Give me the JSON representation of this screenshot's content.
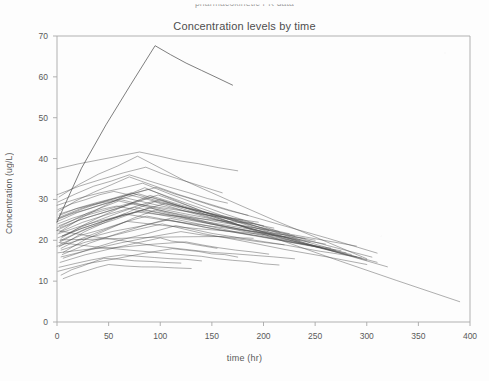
{
  "page": {
    "cut_off_header": "pharmacokinetic PK data",
    "background_color": "#fdfdfd",
    "line_color": "#4a4a4a",
    "frame_color": "#a8a8a8",
    "text_color": "#5a5a5a"
  },
  "chart_data": {
    "type": "line",
    "title": "Concentration levels by time",
    "subtitle": "",
    "xlabel": "time (hr)",
    "ylabel": "Concentration (ug/L)",
    "xlim": [
      0,
      400
    ],
    "ylim": [
      0,
      70
    ],
    "xticks": [
      0,
      50,
      100,
      150,
      200,
      250,
      300,
      350,
      400
    ],
    "xtick_labels": [
      "0",
      "50",
      "100",
      "150",
      "200",
      "250",
      "300",
      "350",
      "400"
    ],
    "yticks": [
      0,
      10,
      20,
      30,
      40,
      50,
      60,
      70
    ],
    "ytick_labels": [
      "0",
      "10",
      "20",
      "30",
      "40",
      "50",
      "60",
      "70"
    ],
    "grid": false,
    "legend": "none",
    "legend_position": "none",
    "series_count": 46,
    "series": [
      {
        "name": "subject-01",
        "x": [
          0,
          95,
          170
        ],
        "values": [
          24.5,
          67.5,
          58.0
        ]
      },
      {
        "name": "subject-02",
        "x": [
          0,
          80,
          175
        ],
        "values": [
          37.5,
          41.5,
          37.0
        ]
      },
      {
        "name": "subject-03",
        "x": [
          2,
          78,
          300
        ],
        "values": [
          30.5,
          40.5,
          15.5
        ]
      },
      {
        "name": "subject-04",
        "x": [
          3,
          85,
          390
        ],
        "values": [
          22.0,
          33.0,
          5.0
        ]
      },
      {
        "name": "subject-05",
        "x": [
          1,
          70,
          310
        ],
        "values": [
          27.0,
          35.5,
          17.0
        ]
      },
      {
        "name": "subject-06",
        "x": [
          4,
          90,
          305
        ],
        "values": [
          20.5,
          31.0,
          16.0
        ]
      },
      {
        "name": "subject-07",
        "x": [
          0,
          60,
          290
        ],
        "values": [
          23.0,
          29.5,
          18.5
        ]
      },
      {
        "name": "subject-08",
        "x": [
          2,
          100,
          300
        ],
        "values": [
          18.5,
          30.0,
          15.0
        ]
      },
      {
        "name": "subject-09",
        "x": [
          5,
          75,
          250
        ],
        "values": [
          21.0,
          28.0,
          20.0
        ]
      },
      {
        "name": "subject-10",
        "x": [
          1,
          88,
          270
        ],
        "values": [
          25.5,
          32.5,
          17.5
        ]
      },
      {
        "name": "subject-11",
        "x": [
          3,
          65,
          230
        ],
        "values": [
          19.5,
          26.5,
          21.0
        ]
      },
      {
        "name": "subject-12",
        "x": [
          0,
          92,
          310
        ],
        "values": [
          22.5,
          30.5,
          14.5
        ]
      },
      {
        "name": "subject-13",
        "x": [
          2,
          72,
          200
        ],
        "values": [
          26.0,
          31.5,
          23.5
        ]
      },
      {
        "name": "subject-14",
        "x": [
          6,
          95,
          285
        ],
        "values": [
          17.0,
          27.5,
          16.5
        ]
      },
      {
        "name": "subject-15",
        "x": [
          1,
          58,
          260
        ],
        "values": [
          24.0,
          28.5,
          19.0
        ]
      },
      {
        "name": "subject-16",
        "x": [
          3,
          105,
          295
        ],
        "values": [
          20.0,
          29.0,
          15.5
        ]
      },
      {
        "name": "subject-17",
        "x": [
          0,
          83,
          215
        ],
        "values": [
          28.5,
          34.0,
          22.0
        ]
      },
      {
        "name": "subject-18",
        "x": [
          4,
          68,
          240
        ],
        "values": [
          18.0,
          24.5,
          20.5
        ]
      },
      {
        "name": "subject-19",
        "x": [
          2,
          98,
          320
        ],
        "values": [
          23.5,
          31.0,
          13.5
        ]
      },
      {
        "name": "subject-20",
        "x": [
          1,
          76,
          190
        ],
        "values": [
          21.5,
          27.0,
          24.0
        ]
      },
      {
        "name": "subject-21",
        "x": [
          5,
          110,
          280
        ],
        "values": [
          16.5,
          25.5,
          17.0
        ]
      },
      {
        "name": "subject-22",
        "x": [
          0,
          62,
          205
        ],
        "values": [
          25.0,
          30.0,
          22.5
        ]
      },
      {
        "name": "subject-23",
        "x": [
          3,
          87,
          265
        ],
        "values": [
          19.0,
          26.0,
          18.0
        ]
      },
      {
        "name": "subject-24",
        "x": [
          2,
          93,
          235
        ],
        "values": [
          22.0,
          29.5,
          20.0
        ]
      },
      {
        "name": "subject-25",
        "x": [
          1,
          55,
          180
        ],
        "values": [
          27.5,
          32.0,
          25.0
        ]
      },
      {
        "name": "subject-26",
        "x": [
          4,
          102,
          300
        ],
        "values": [
          17.5,
          24.0,
          14.0
        ]
      },
      {
        "name": "subject-27",
        "x": [
          0,
          79,
          225
        ],
        "values": [
          24.5,
          31.5,
          21.5
        ]
      },
      {
        "name": "subject-28",
        "x": [
          6,
          115,
          290
        ],
        "values": [
          15.5,
          23.5,
          16.0
        ]
      },
      {
        "name": "subject-29",
        "x": [
          2,
          66,
          210
        ],
        "values": [
          26.5,
          30.5,
          23.0
        ]
      },
      {
        "name": "subject-30",
        "x": [
          1,
          90,
          255
        ],
        "values": [
          20.5,
          28.0,
          18.5
        ]
      },
      {
        "name": "subject-31",
        "x": [
          3,
          74,
          195
        ],
        "values": [
          23.0,
          29.0,
          24.5
        ]
      },
      {
        "name": "subject-32",
        "x": [
          0,
          108,
          275
        ],
        "values": [
          18.5,
          25.0,
          17.5
        ]
      },
      {
        "name": "subject-33",
        "x": [
          5,
          84,
          245
        ],
        "values": [
          21.0,
          27.5,
          19.5
        ]
      },
      {
        "name": "subject-34",
        "x": [
          2,
          96,
          185
        ],
        "values": [
          25.5,
          33.0,
          26.0
        ]
      },
      {
        "name": "subject-35",
        "x": [
          1,
          70,
          165
        ],
        "values": [
          29.5,
          36.0,
          29.0
        ]
      },
      {
        "name": "subject-36",
        "x": [
          4,
          120,
          220
        ],
        "values": [
          16.0,
          22.0,
          19.0
        ]
      },
      {
        "name": "subject-37",
        "x": [
          0,
          86,
          160
        ],
        "values": [
          31.0,
          38.0,
          31.5
        ]
      },
      {
        "name": "subject-38",
        "x": [
          3,
          100,
          155
        ],
        "values": [
          14.5,
          20.5,
          18.0
        ]
      },
      {
        "name": "subject-39",
        "x": [
          2,
          64,
          140
        ],
        "values": [
          13.5,
          16.5,
          15.0
        ]
      },
      {
        "name": "subject-40",
        "x": [
          1,
          112,
          175
        ],
        "values": [
          12.5,
          18.0,
          16.0
        ]
      },
      {
        "name": "subject-41",
        "x": [
          6,
          50,
          130
        ],
        "values": [
          10.5,
          14.0,
          13.0
        ]
      },
      {
        "name": "subject-42",
        "x": [
          0,
          130,
          230
        ],
        "values": [
          22.5,
          17.5,
          15.5
        ]
      },
      {
        "name": "subject-43",
        "x": [
          4,
          45,
          120
        ],
        "values": [
          11.5,
          15.5,
          14.5
        ]
      },
      {
        "name": "subject-44",
        "x": [
          2,
          140,
          215
        ],
        "values": [
          19.5,
          16.0,
          14.0
        ]
      },
      {
        "name": "subject-45",
        "x": [
          1,
          125,
          205
        ],
        "values": [
          17.0,
          19.5,
          16.5
        ]
      },
      {
        "name": "subject-46",
        "x": [
          3,
          160,
          190
        ],
        "values": [
          20.0,
          21.0,
          20.5
        ]
      }
    ]
  }
}
